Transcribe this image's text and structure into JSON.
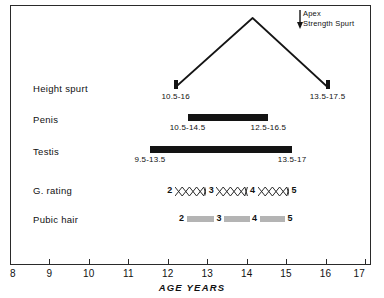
{
  "chart_data": {
    "type": "table",
    "xlabel": "AGE  YEARS",
    "ylabel": "",
    "xlim": [
      8,
      17
    ],
    "xticks": [
      "8",
      "9",
      "10",
      "11",
      "12",
      "13",
      "14",
      "15",
      "16",
      "17"
    ],
    "grid": false,
    "legend": null,
    "annotations": [
      {
        "name": "apex-strength-spurt",
        "line1": "Apex",
        "line2": "Strength Spurt",
        "arrow": "down"
      }
    ],
    "rows": [
      {
        "label": "Height spurt",
        "kind": "curve",
        "start_age": 12.2,
        "peak_age": 14.15,
        "end_age": 16.05,
        "captions": [
          {
            "text": "10.5-16",
            "age": 12.2
          },
          {
            "text": "13.5-17.5",
            "age": 16.05
          }
        ]
      },
      {
        "label": "Penis",
        "kind": "bar-black",
        "start_age": 12.5,
        "end_age": 14.55,
        "captions": [
          {
            "text": "10.5-14.5",
            "age": 12.5
          },
          {
            "text": "12.5-16.5",
            "age": 14.55
          }
        ]
      },
      {
        "label": "Testis",
        "kind": "bar-black",
        "start_age": 11.55,
        "end_age": 15.15,
        "captions": [
          {
            "text": "9.5-13.5",
            "age": 11.55
          },
          {
            "text": "13.5-17",
            "age": 15.15
          }
        ]
      },
      {
        "label": "G. rating",
        "kind": "hatched-stages",
        "stages": [
          "2",
          "3",
          "4",
          "5"
        ],
        "stage_ages": [
          12.05,
          13.1,
          14.15,
          15.2
        ],
        "pattern": "cross-hatch"
      },
      {
        "label": "Pubic hair",
        "kind": "shaded-stages",
        "stages": [
          "2",
          "3",
          "4",
          "5"
        ],
        "stage_ages": [
          12.35,
          13.3,
          14.2,
          15.1
        ],
        "pattern": "gray-fill"
      }
    ],
    "colors": {
      "bar_black": "#131313",
      "bar_gray": "#b4b4b4",
      "axis": "#2a2a2a",
      "background": "#ffffff"
    }
  }
}
